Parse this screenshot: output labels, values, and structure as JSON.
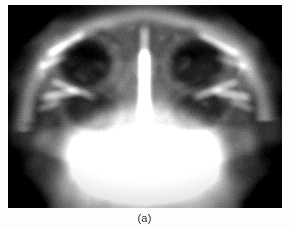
{
  "figure": {
    "caption": "(a)",
    "panel_label": "a",
    "modality": "x-ray-radiograph",
    "view": "frontal-skull-paranasal-sinuses",
    "colorspace": "grayscale"
  },
  "image": {
    "alt": "Frontal radiograph of a human skull showing the paranasal sinuses, orbits and nasal septum",
    "frame": {
      "x": 8,
      "y": 5,
      "width": 274,
      "height": 203
    },
    "background_color": "#0a0a0a",
    "border_color": "#111111",
    "page_background": "#fdfdfc",
    "caption_color": "#2b2b2b"
  },
  "anatomy": {
    "regions": [
      {
        "name": "cranial-vault-outline",
        "brightness": "mid-bright",
        "cx": 144,
        "cy": 120,
        "rx": 128,
        "ry": 112
      },
      {
        "name": "frontal-sinus-left",
        "brightness": "mid",
        "cx": 108,
        "cy": 30,
        "rx": 34,
        "ry": 20
      },
      {
        "name": "frontal-sinus-right",
        "brightness": "mid",
        "cx": 176,
        "cy": 30,
        "rx": 34,
        "ry": 20
      },
      {
        "name": "orbit-left",
        "brightness": "dark",
        "cx": 85,
        "cy": 60,
        "rx": 34,
        "ry": 31
      },
      {
        "name": "orbit-right",
        "brightness": "dark",
        "cx": 196,
        "cy": 61,
        "rx": 34,
        "ry": 31
      },
      {
        "name": "nasal-septum",
        "brightness": "bright",
        "cx": 143,
        "cy": 92,
        "rx": 5,
        "ry": 38
      },
      {
        "name": "maxillary-sinus-left",
        "brightness": "dark",
        "cx": 92,
        "cy": 110,
        "rx": 31,
        "ry": 23
      },
      {
        "name": "maxillary-sinus-right",
        "brightness": "dark",
        "cx": 196,
        "cy": 110,
        "rx": 31,
        "ry": 23
      },
      {
        "name": "maxilla-teeth-region",
        "brightness": "very-bright",
        "cx": 143,
        "cy": 150,
        "rx": 62,
        "ry": 42
      },
      {
        "name": "mandible-base",
        "brightness": "bright",
        "cx": 143,
        "cy": 185,
        "rx": 78,
        "ry": 26
      },
      {
        "name": "temporal-region-left",
        "brightness": "dark",
        "cx": 30,
        "cy": 150,
        "rx": 34,
        "ry": 48
      },
      {
        "name": "temporal-region-right",
        "brightness": "dark",
        "cx": 252,
        "cy": 150,
        "rx": 34,
        "ry": 48
      },
      {
        "name": "background-corner-upper-left",
        "brightness": "black",
        "cx": 6,
        "cy": 6,
        "rx": 26,
        "ry": 22
      },
      {
        "name": "background-corner-upper-right",
        "brightness": "black",
        "cx": 268,
        "cy": 6,
        "rx": 26,
        "ry": 22
      }
    ]
  }
}
